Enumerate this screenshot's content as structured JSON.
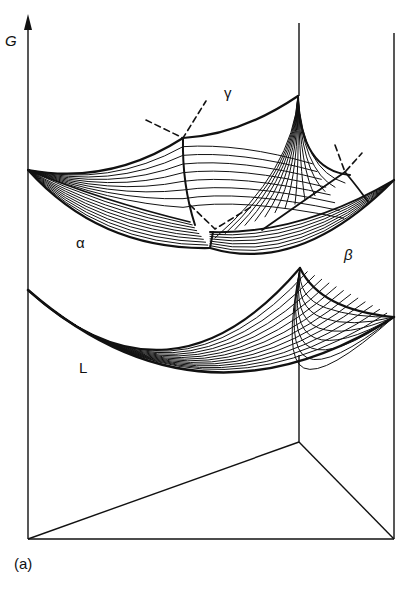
{
  "figure": {
    "caption": "(a)",
    "axis_label": "G",
    "phase_labels": {
      "alpha": "α",
      "beta": "β",
      "gamma": "γ",
      "liquid": "L"
    },
    "colors": {
      "ink": "#111111",
      "background": "#ffffff"
    },
    "frame": {
      "left_axis": [
        28,
        22,
        28,
        539
      ],
      "right_edge": [
        394,
        33,
        394,
        539
      ],
      "back_edge": [
        299,
        23,
        299,
        96
      ],
      "base_back": [
        299,
        355,
        299,
        442
      ],
      "base_front": [
        28,
        539,
        394,
        539
      ],
      "base_left": [
        28,
        539,
        299,
        442
      ],
      "base_right": [
        394,
        539,
        299,
        442
      ]
    },
    "surfaces": {
      "solid": {
        "A": [
          28,
          170
        ],
        "B": [
          394,
          180
        ],
        "C": [
          298,
          96
        ]
      },
      "liquid": {
        "A": [
          28,
          290
        ],
        "B": [
          394,
          317
        ],
        "C": [
          300,
          268
        ]
      }
    }
  }
}
